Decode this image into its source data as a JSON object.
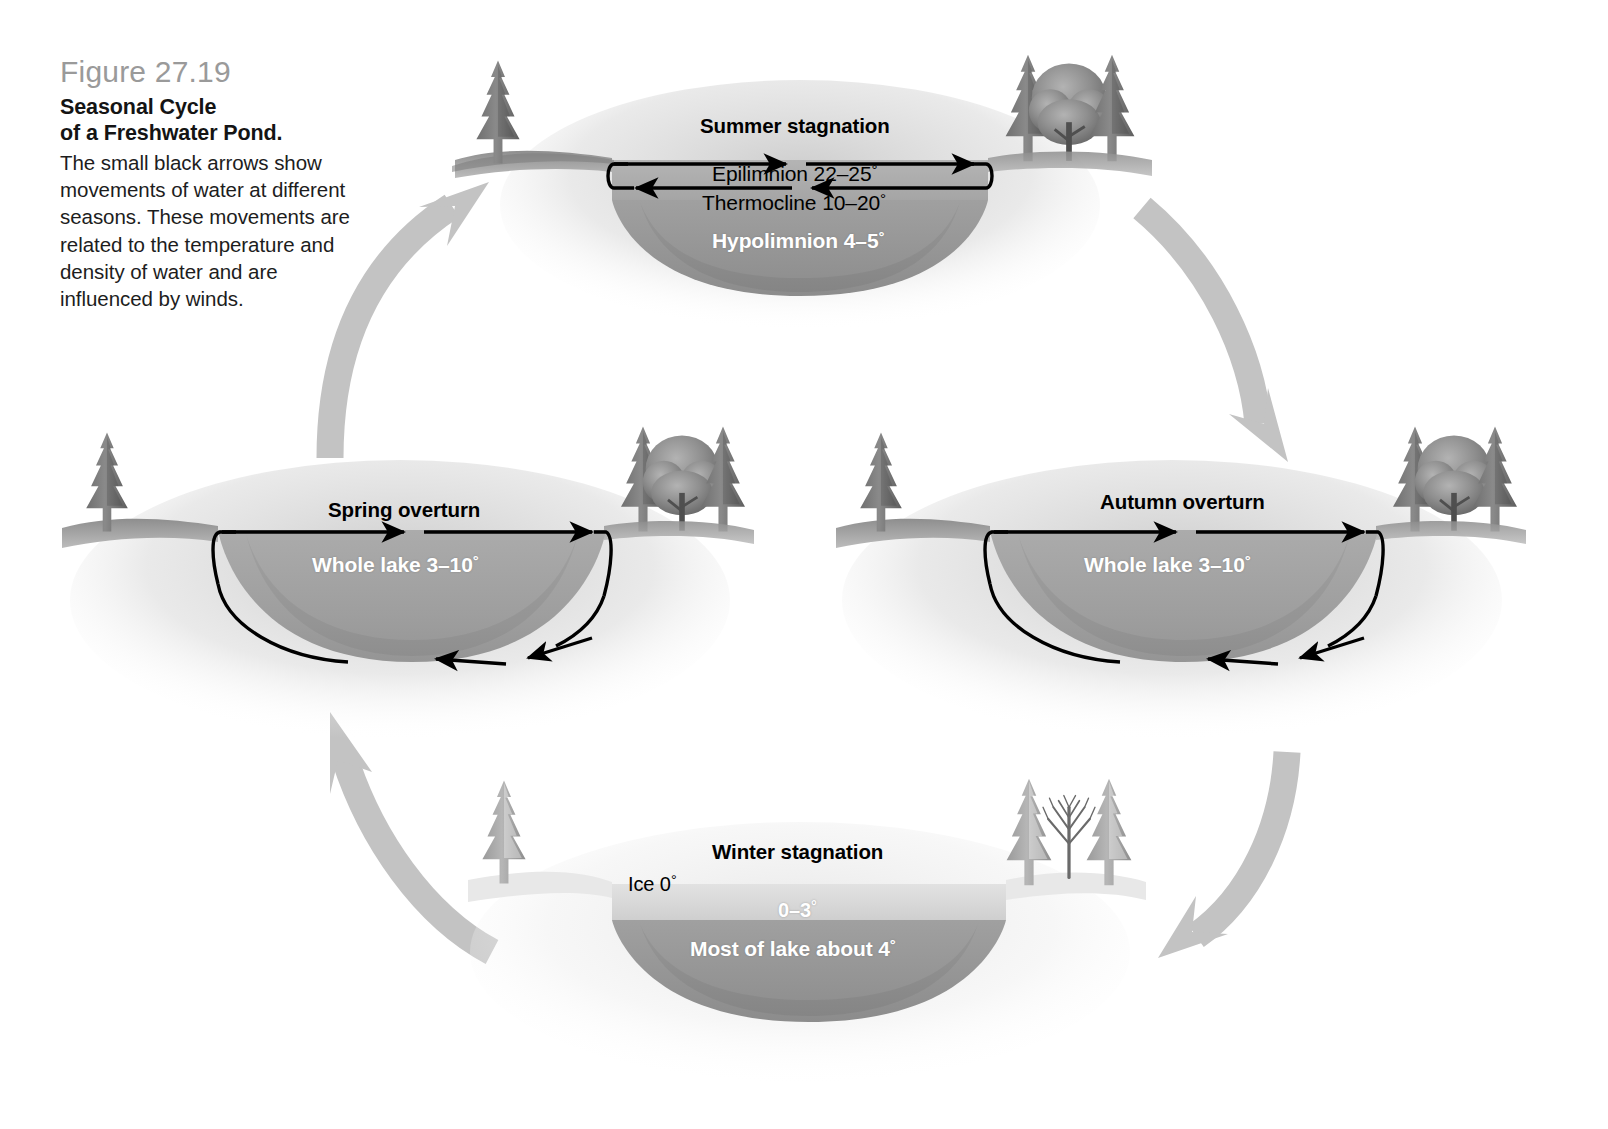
{
  "figure": {
    "number": "Figure 27.19",
    "title_line1": "Seasonal Cycle",
    "title_line2": "of a Freshwater Pond.",
    "caption": "The small black arrows show movements of water at different seasons. These movements are related to the temperature and density of water and are influenced by winds."
  },
  "colors": {
    "cycle_arrow": "#c3c3c3",
    "water_upper": "#a8a8a8",
    "water_lower": "#9a9a9a",
    "water_deep": "#8f8f8f",
    "ice": "#d8d8d8",
    "shore": "#cfcfcf",
    "flow_arrow": "#000000",
    "caption_number": "#9a9a9a",
    "label_dark": "#000000",
    "label_light": "#ffffff"
  },
  "panels": {
    "summer": {
      "season": "Summer stagnation",
      "layers": [
        {
          "name": "Epilimnion",
          "label": "Epilimnion 22–25",
          "value": "22–25",
          "unit": "°",
          "text_color": "dark"
        },
        {
          "name": "Thermocline",
          "label": "Thermocline 10–20",
          "value": "10–20",
          "unit": "°",
          "text_color": "dark"
        },
        {
          "name": "Hypolimnion",
          "label": "Hypolimnion 4–5",
          "value": "4–5",
          "unit": "°",
          "text_color": "light"
        }
      ],
      "trees_left": "single-conifer",
      "trees_right": "two-conifers-one-deciduous",
      "circulation": "epilimnion-only"
    },
    "autumn": {
      "season": "Autumn overturn",
      "layers": [
        {
          "name": "Whole lake",
          "label": "Whole lake 3–10",
          "value": "3–10",
          "unit": "°",
          "text_color": "light"
        }
      ],
      "trees_left": "single-conifer",
      "trees_right": "two-conifers-one-deciduous",
      "circulation": "full-depth"
    },
    "winter": {
      "season": "Winter stagnation",
      "layers": [
        {
          "name": "Ice",
          "label": "Ice 0",
          "value": "0",
          "unit": "°",
          "text_color": "dark"
        },
        {
          "name": "Upper water",
          "label": "0–3",
          "value": "0–3",
          "unit": "°",
          "text_color": "light"
        },
        {
          "name": "Deep water",
          "label": "Most of lake about 4",
          "value": "4",
          "unit": "°",
          "text_color": "light"
        }
      ],
      "trees_left": "single-snowy-conifer",
      "trees_right": "two-snowy-conifers-one-bare",
      "circulation": "none"
    },
    "spring": {
      "season": "Spring overturn",
      "layers": [
        {
          "name": "Whole lake",
          "label": "Whole lake 3–10",
          "value": "3–10",
          "unit": "°",
          "text_color": "light"
        }
      ],
      "trees_left": "single-conifer",
      "trees_right": "two-conifers-one-deciduous",
      "circulation": "full-depth"
    }
  },
  "cycle_arrows": [
    {
      "from": "spring",
      "to": "summer",
      "direction": "up-right",
      "position": "upper-left"
    },
    {
      "from": "summer",
      "to": "autumn",
      "direction": "down-right",
      "position": "upper-right"
    },
    {
      "from": "autumn",
      "to": "winter",
      "direction": "down-left",
      "position": "lower-right"
    },
    {
      "from": "winter",
      "to": "spring",
      "direction": "up-left",
      "position": "lower-left"
    }
  ]
}
